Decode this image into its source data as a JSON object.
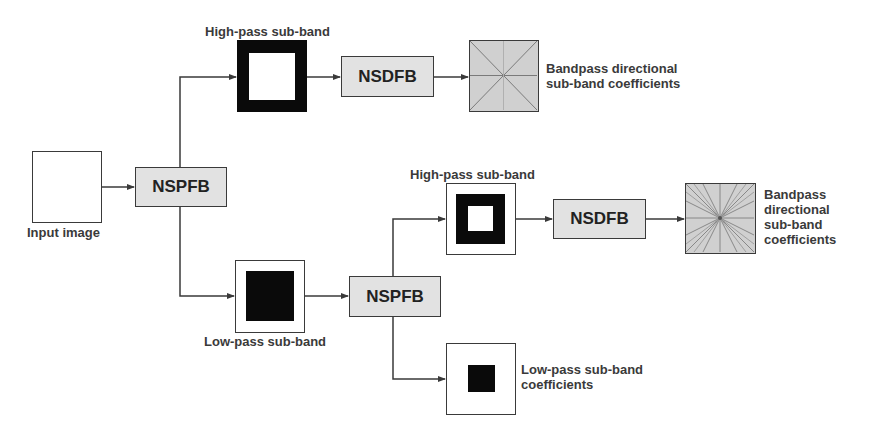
{
  "diagram": {
    "colors": {
      "line": "#3a3a3a",
      "process_fill": "#e2e2e2",
      "coef_fill": "#cfcfcf",
      "black": "#0a0a0a"
    },
    "nodes": {
      "input_image": {
        "label": "Input image"
      },
      "nspfb_1": {
        "label": "NSPFB"
      },
      "highpass_1": {
        "label": "High-pass sub-band"
      },
      "nsdfb_1": {
        "label": "NSDFB"
      },
      "bandpass_1": {
        "label_line1": "Bandpass directional",
        "label_line2": "sub-band coefficients"
      },
      "lowpass_1": {
        "label": "Low-pass sub-band"
      },
      "nspfb_2": {
        "label": "NSPFB"
      },
      "highpass_2": {
        "label": "High-pass sub-band"
      },
      "nsdfb_2": {
        "label": "NSDFB"
      },
      "bandpass_2": {
        "label_line1": "Bandpass",
        "label_line2": "directional",
        "label_line3": "sub-band",
        "label_line4": "coefficients"
      },
      "lowpass_coeff": {
        "label_line1": "Low-pass sub-band",
        "label_line2": "coefficients"
      }
    },
    "edges": [
      {
        "from": "input_image",
        "to": "nspfb_1"
      },
      {
        "from": "nspfb_1",
        "to": "highpass_1"
      },
      {
        "from": "highpass_1",
        "to": "nsdfb_1"
      },
      {
        "from": "nsdfb_1",
        "to": "bandpass_1"
      },
      {
        "from": "nspfb_1",
        "to": "lowpass_1"
      },
      {
        "from": "lowpass_1",
        "to": "nspfb_2"
      },
      {
        "from": "nspfb_2",
        "to": "highpass_2"
      },
      {
        "from": "highpass_2",
        "to": "nsdfb_2"
      },
      {
        "from": "nsdfb_2",
        "to": "bandpass_2"
      },
      {
        "from": "nspfb_2",
        "to": "lowpass_coeff"
      }
    ]
  }
}
